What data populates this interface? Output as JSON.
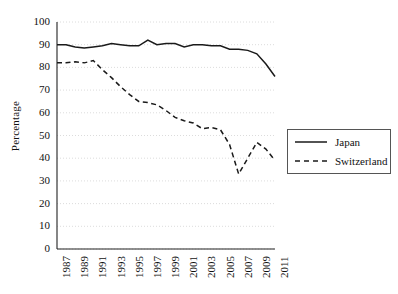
{
  "chart_data": {
    "type": "line",
    "title": "",
    "xlabel": "",
    "ylabel": "Percentage",
    "ylim": [
      0,
      100
    ],
    "yticks": [
      0,
      10,
      20,
      30,
      40,
      50,
      60,
      70,
      80,
      90,
      100
    ],
    "xlim": [
      1987,
      2011
    ],
    "x": [
      1987,
      1988,
      1989,
      1990,
      1991,
      1992,
      1993,
      1994,
      1995,
      1996,
      1997,
      1998,
      1999,
      2000,
      2001,
      2002,
      2003,
      2004,
      2005,
      2006,
      2007,
      2008,
      2009,
      2010,
      2011
    ],
    "xticks": [
      1987,
      1989,
      1991,
      1993,
      1995,
      1997,
      1999,
      2001,
      2003,
      2005,
      2007,
      2009,
      2011
    ],
    "xtick_labels": [
      "1987",
      "1989",
      "1991",
      "1993",
      "1995",
      "1997",
      "1999",
      "2001",
      "2003",
      "2005",
      "2007",
      "2009",
      "2011"
    ],
    "grid": "horizontal-dotted",
    "legend_position": "right",
    "series": [
      {
        "name": "Japan",
        "style": "solid",
        "color": "#1a1a1a",
        "values": [
          90,
          90,
          89,
          88.5,
          89,
          89.5,
          90.5,
          90,
          89.5,
          89.5,
          92,
          90,
          90.5,
          90.5,
          89,
          90,
          90,
          89.5,
          89.5,
          88,
          88,
          87.5,
          86,
          81.5,
          76
        ]
      },
      {
        "name": "Switzerland",
        "style": "dashed",
        "color": "#1a1a1a",
        "values": [
          82,
          82,
          82.5,
          82,
          83,
          79,
          75.5,
          71.5,
          68,
          65,
          64.5,
          63.5,
          61,
          58,
          56.5,
          55.5,
          53,
          53.5,
          52.5,
          46,
          33,
          40,
          47,
          44,
          39
        ]
      }
    ]
  },
  "legend": {
    "items": [
      {
        "label": "Japan",
        "style": "solid"
      },
      {
        "label": "Switzerland",
        "style": "dashed"
      }
    ]
  }
}
